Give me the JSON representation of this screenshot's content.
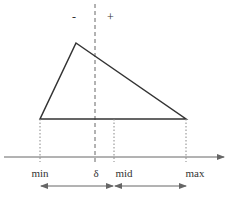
{
  "diagram": {
    "type": "triangular-membership-with-threshold",
    "signs": {
      "minus": "-",
      "plus": "+"
    },
    "axis_labels": {
      "min": "min",
      "delta": "δ",
      "mid": "mid",
      "max": "max"
    },
    "geometry": {
      "apex": [
        76,
        43
      ],
      "base_left": [
        40,
        119
      ],
      "base_right": [
        186,
        119
      ],
      "axis_y": 157,
      "delta_x": 95,
      "mid_x": 114,
      "range_arrows_y": 186
    },
    "colors": {
      "line": "#333333",
      "guide": "#888888"
    }
  }
}
